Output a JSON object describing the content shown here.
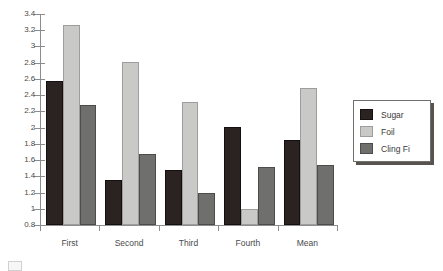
{
  "chart_data": {
    "type": "bar",
    "title": "",
    "subtitle": "",
    "xlabel": "",
    "ylabel": "",
    "categories": [
      "First",
      "Second",
      "Third",
      "Fourth",
      "Mean"
    ],
    "series": [
      {
        "name": "Sugar",
        "color": "#2b2321",
        "values": [
          2.57,
          1.35,
          1.48,
          2.01,
          1.85
        ]
      },
      {
        "name": "Foil",
        "color": "#c9c9c7",
        "values": [
          3.27,
          2.81,
          2.31,
          1.0,
          2.49
        ]
      },
      {
        "name": "Cling Fi",
        "color": "#6f6f6e",
        "values": [
          2.28,
          1.68,
          1.19,
          1.52,
          1.54
        ]
      }
    ],
    "ylim": [
      0.8,
      3.4
    ],
    "ytick_step": 0.2,
    "ytick_labels": [
      "3.4",
      "3.2",
      "3",
      "2.8",
      "2.6",
      "2.4",
      "2.2",
      "2",
      "1.8",
      "1.6",
      "1.4",
      "1.2",
      "1",
      "0.8"
    ],
    "grid": false,
    "legend_position": "right",
    "legend_entries": [
      "Sugar",
      "Foil",
      "Cling Fi"
    ],
    "axis_color": "#8d8d8d",
    "background": "#ffffff"
  },
  "legend": {
    "items": [
      {
        "label": "Sugar"
      },
      {
        "label": "Foil"
      },
      {
        "label": "Cling Fi"
      }
    ]
  },
  "caption": {
    "text": ""
  }
}
